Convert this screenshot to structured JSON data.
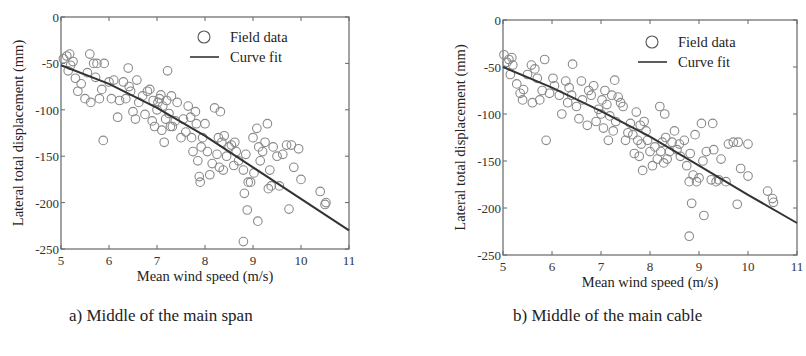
{
  "figure": {
    "panels": [
      {
        "caption": "a) Middle of the main span"
      },
      {
        "caption": "b) Middle of the main cable"
      }
    ]
  },
  "chart_data": [
    {
      "type": "scatter",
      "title": "a) Middle of the main span",
      "xlabel": "Mean wind speed (m/s)",
      "ylabel": "Lateral total displacement (mm)",
      "xlim": [
        5,
        11
      ],
      "ylim": [
        -250,
        0
      ],
      "xticks": [
        5,
        6,
        7,
        8,
        9,
        10,
        11
      ],
      "yticks": [
        0,
        -50,
        -100,
        -150,
        -200,
        -250
      ],
      "grid": false,
      "legend": {
        "position": "upper right",
        "entries": [
          "Field data",
          "Curve fit"
        ]
      },
      "colors": {
        "marker": "#8a8a8a",
        "line": "#333333",
        "axis": "#666666"
      },
      "series": [
        {
          "name": "Field data",
          "kind": "scatter",
          "marker": "open-circle",
          "points": [
            [
              5.05,
              -45
            ],
            [
              5.12,
              -42
            ],
            [
              5.18,
              -40
            ],
            [
              5.2,
              -52
            ],
            [
              5.25,
              -48
            ],
            [
              5.15,
              -58
            ],
            [
              5.3,
              -66
            ],
            [
              5.35,
              -80
            ],
            [
              5.42,
              -72
            ],
            [
              5.5,
              -88
            ],
            [
              5.55,
              -60
            ],
            [
              5.6,
              -40
            ],
            [
              5.62,
              -92
            ],
            [
              5.68,
              -50
            ],
            [
              5.72,
              -65
            ],
            [
              5.75,
              -50
            ],
            [
              5.8,
              -88
            ],
            [
              5.85,
              -78
            ],
            [
              5.88,
              -133
            ],
            [
              5.9,
              -50
            ],
            [
              6.0,
              -70
            ],
            [
              6.05,
              -88
            ],
            [
              6.1,
              -68
            ],
            [
              6.18,
              -108
            ],
            [
              6.22,
              -90
            ],
            [
              6.3,
              -70
            ],
            [
              6.35,
              -88
            ],
            [
              6.4,
              -55
            ],
            [
              6.42,
              -75
            ],
            [
              6.45,
              -80
            ],
            [
              6.5,
              -102
            ],
            [
              6.55,
              -110
            ],
            [
              6.58,
              -68
            ],
            [
              6.62,
              -92
            ],
            [
              6.7,
              -85
            ],
            [
              6.75,
              -105
            ],
            [
              6.8,
              -80
            ],
            [
              6.85,
              -78
            ],
            [
              6.9,
              -112
            ],
            [
              6.92,
              -90
            ],
            [
              6.95,
              -118
            ],
            [
              7.0,
              -100
            ],
            [
              7.02,
              -92
            ],
            [
              7.05,
              -88
            ],
            [
              7.08,
              -84
            ],
            [
              7.1,
              -122
            ],
            [
              7.12,
              -96
            ],
            [
              7.15,
              -135
            ],
            [
              7.18,
              -110
            ],
            [
              7.2,
              -90
            ],
            [
              7.22,
              -58
            ],
            [
              7.25,
              -104
            ],
            [
              7.28,
              -118
            ],
            [
              7.3,
              -85
            ],
            [
              7.32,
              -118
            ],
            [
              7.38,
              -112
            ],
            [
              7.42,
              -92
            ],
            [
              7.5,
              -130
            ],
            [
              7.55,
              -110
            ],
            [
              7.6,
              -124
            ],
            [
              7.65,
              -96
            ],
            [
              7.7,
              -108
            ],
            [
              7.72,
              -130
            ],
            [
              7.75,
              -145
            ],
            [
              7.8,
              -102
            ],
            [
              7.82,
              -115
            ],
            [
              7.85,
              -155
            ],
            [
              7.88,
              -172
            ],
            [
              7.9,
              -178
            ],
            [
              7.92,
              -140
            ],
            [
              7.95,
              -130
            ],
            [
              8.0,
              -115
            ],
            [
              8.05,
              -145
            ],
            [
              8.1,
              -170
            ],
            [
              8.15,
              -158
            ],
            [
              8.2,
              -98
            ],
            [
              8.25,
              -148
            ],
            [
              8.28,
              -130
            ],
            [
              8.3,
              -162
            ],
            [
              8.32,
              -102
            ],
            [
              8.35,
              -135
            ],
            [
              8.38,
              -165
            ],
            [
              8.4,
              -128
            ],
            [
              8.45,
              -150
            ],
            [
              8.5,
              -140
            ],
            [
              8.55,
              -138
            ],
            [
              8.6,
              -160
            ],
            [
              8.62,
              -135
            ],
            [
              8.65,
              -145
            ],
            [
              8.7,
              -155
            ],
            [
              8.8,
              -165
            ],
            [
              8.82,
              -190
            ],
            [
              8.85,
              -148
            ],
            [
              8.88,
              -208
            ],
            [
              8.9,
              -178
            ],
            [
              8.95,
              -178
            ],
            [
              9.0,
              -130
            ],
            [
              9.02,
              -168
            ],
            [
              9.08,
              -120
            ],
            [
              9.1,
              -220
            ],
            [
              9.12,
              -140
            ],
            [
              9.15,
              -155
            ],
            [
              9.2,
              -145
            ],
            [
              9.25,
              -135
            ],
            [
              9.3,
              -115
            ],
            [
              9.32,
              -185
            ],
            [
              9.35,
              -165
            ],
            [
              9.38,
              -182
            ],
            [
              9.42,
              -140
            ],
            [
              9.5,
              -150
            ],
            [
              9.55,
              -182
            ],
            [
              9.62,
              -148
            ],
            [
              9.7,
              -138
            ],
            [
              9.75,
              -207
            ],
            [
              9.8,
              -138
            ],
            [
              9.85,
              -162
            ],
            [
              9.95,
              -142
            ],
            [
              10.0,
              -175
            ],
            [
              10.4,
              -188
            ],
            [
              10.5,
              -202
            ],
            [
              10.52,
              -200
            ],
            [
              8.8,
              -242
            ]
          ]
        },
        {
          "name": "Curve fit",
          "kind": "line",
          "x": [
            5,
            6,
            7,
            8,
            9,
            10,
            11
          ],
          "y": [
            -52,
            -72,
            -98,
            -128,
            -162,
            -196,
            -230
          ]
        }
      ]
    },
    {
      "type": "scatter",
      "title": "b) Middle of the main cable",
      "xlabel": "Mean wind speed (m/s)",
      "ylabel": "Lateral total displacement (mm)",
      "xlim": [
        5,
        11
      ],
      "ylim": [
        -250,
        0
      ],
      "xticks": [
        5,
        6,
        7,
        8,
        9,
        10,
        11
      ],
      "yticks": [
        0,
        -50,
        -100,
        -150,
        -200,
        -250
      ],
      "grid": false,
      "legend": {
        "position": "upper right",
        "entries": [
          "Field data",
          "Curve fit"
        ]
      },
      "colors": {
        "marker": "#8a8a8a",
        "line": "#333333",
        "axis": "#666666"
      },
      "series": [
        {
          "name": "Field data",
          "kind": "scatter",
          "marker": "open-circle",
          "points": [
            [
              5.02,
              -37
            ],
            [
              5.08,
              -45
            ],
            [
              5.12,
              -42
            ],
            [
              5.18,
              -40
            ],
            [
              5.2,
              -48
            ],
            [
              5.15,
              -58
            ],
            [
              5.28,
              -68
            ],
            [
              5.35,
              -78
            ],
            [
              5.4,
              -85
            ],
            [
              5.42,
              -74
            ],
            [
              5.5,
              -58
            ],
            [
              5.58,
              -48
            ],
            [
              5.6,
              -88
            ],
            [
              5.65,
              -52
            ],
            [
              5.7,
              -62
            ],
            [
              5.75,
              -85
            ],
            [
              5.8,
              -75
            ],
            [
              5.85,
              -42
            ],
            [
              5.88,
              -128
            ],
            [
              5.95,
              -78
            ],
            [
              6.02,
              -62
            ],
            [
              6.05,
              -70
            ],
            [
              6.15,
              -80
            ],
            [
              6.2,
              -100
            ],
            [
              6.28,
              -65
            ],
            [
              6.32,
              -88
            ],
            [
              6.35,
              -72
            ],
            [
              6.4,
              -80
            ],
            [
              6.42,
              -47
            ],
            [
              6.5,
              -92
            ],
            [
              6.55,
              -105
            ],
            [
              6.6,
              -65
            ],
            [
              6.62,
              -85
            ],
            [
              6.72,
              -112
            ],
            [
              6.75,
              -75
            ],
            [
              6.8,
              -80
            ],
            [
              6.85,
              -70
            ],
            [
              6.9,
              -108
            ],
            [
              6.95,
              -95
            ],
            [
              7.0,
              -100
            ],
            [
              7.02,
              -85
            ],
            [
              7.05,
              -115
            ],
            [
              7.08,
              -75
            ],
            [
              7.12,
              -90
            ],
            [
              7.15,
              -128
            ],
            [
              7.18,
              -102
            ],
            [
              7.22,
              -80
            ],
            [
              7.25,
              -118
            ],
            [
              7.28,
              -64
            ],
            [
              7.3,
              -108
            ],
            [
              7.35,
              -82
            ],
            [
              7.4,
              -88
            ],
            [
              7.45,
              -92
            ],
            [
              7.5,
              -128
            ],
            [
              7.55,
              -120
            ],
            [
              7.6,
              -110
            ],
            [
              7.65,
              -122
            ],
            [
              7.68,
              -142
            ],
            [
              7.72,
              -98
            ],
            [
              7.75,
              -128
            ],
            [
              7.78,
              -145
            ],
            [
              7.8,
              -112
            ],
            [
              7.82,
              -132
            ],
            [
              7.85,
              -160
            ],
            [
              7.88,
              -108
            ],
            [
              7.92,
              -118
            ],
            [
              7.95,
              -128
            ],
            [
              8.0,
              -140
            ],
            [
              8.05,
              -155
            ],
            [
              8.1,
              -135
            ],
            [
              8.15,
              -148
            ],
            [
              8.2,
              -92
            ],
            [
              8.22,
              -140
            ],
            [
              8.25,
              -130
            ],
            [
              8.28,
              -152
            ],
            [
              8.3,
              -100
            ],
            [
              8.32,
              -125
            ],
            [
              8.35,
              -148
            ],
            [
              8.4,
              -140
            ],
            [
              8.45,
              -130
            ],
            [
              8.5,
              -118
            ],
            [
              8.55,
              -138
            ],
            [
              8.6,
              -132
            ],
            [
              8.62,
              -145
            ],
            [
              8.7,
              -128
            ],
            [
              8.75,
              -155
            ],
            [
              8.8,
              -172
            ],
            [
              8.82,
              -142
            ],
            [
              8.85,
              -195
            ],
            [
              8.88,
              -165
            ],
            [
              8.92,
              -122
            ],
            [
              8.95,
              -172
            ],
            [
              9.0,
              -168
            ],
            [
              9.05,
              -110
            ],
            [
              9.08,
              -150
            ],
            [
              9.1,
              -208
            ],
            [
              9.15,
              -140
            ],
            [
              9.25,
              -170
            ],
            [
              9.28,
              -110
            ],
            [
              9.3,
              -138
            ],
            [
              9.35,
              -172
            ],
            [
              9.4,
              -170
            ],
            [
              9.45,
              -148
            ],
            [
              9.55,
              -172
            ],
            [
              9.6,
              -132
            ],
            [
              9.7,
              -130
            ],
            [
              9.78,
              -196
            ],
            [
              9.8,
              -130
            ],
            [
              9.85,
              -158
            ],
            [
              10.0,
              -132
            ],
            [
              10.0,
              -166
            ],
            [
              10.4,
              -182
            ],
            [
              10.5,
              -190
            ],
            [
              10.52,
              -194
            ],
            [
              8.8,
              -230
            ]
          ]
        },
        {
          "name": "Curve fit",
          "kind": "line",
          "x": [
            5,
            6,
            7,
            8,
            9,
            10,
            11
          ],
          "y": [
            -50,
            -72,
            -97,
            -124,
            -155,
            -186,
            -216
          ]
        }
      ]
    }
  ]
}
